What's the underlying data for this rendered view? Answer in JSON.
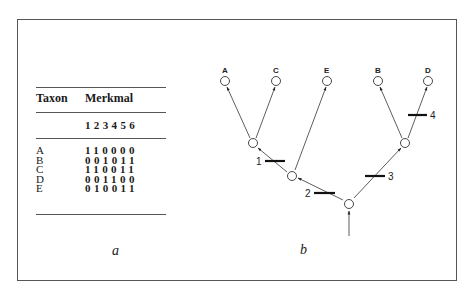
{
  "figure": {
    "panel_a": {
      "caption": "a",
      "table": {
        "header_taxon": "Taxon",
        "header_characters": "Merkmal",
        "character_numbers": "1 2 3 4 5 6",
        "rows": [
          {
            "taxon": "A",
            "values": "110000"
          },
          {
            "taxon": "B",
            "values": "001011"
          },
          {
            "taxon": "C",
            "values": "110011"
          },
          {
            "taxon": "D",
            "values": "001100"
          },
          {
            "taxon": "E",
            "values": "010011"
          }
        ]
      }
    },
    "panel_b": {
      "caption": "b",
      "tree": {
        "tips": [
          "A",
          "C",
          "E",
          "B",
          "D"
        ],
        "character_changes": [
          {
            "label": "1",
            "branch": "ACE-node to AC-node"
          },
          {
            "label": "2",
            "branch": "root to ACE-node"
          },
          {
            "label": "3",
            "branch": "root to BD-node"
          },
          {
            "label": "4",
            "branch": "BD-node to D"
          }
        ]
      }
    }
  }
}
